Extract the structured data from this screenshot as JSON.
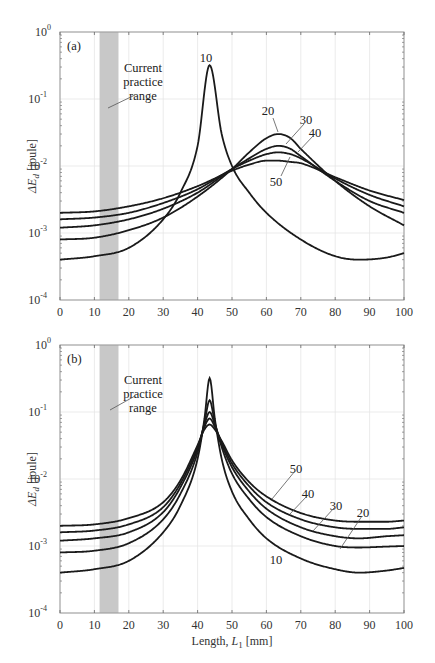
{
  "chart_data": [
    {
      "type": "line",
      "panel_label": "(a)",
      "ylabel": "ΔE_d [joule]",
      "xlabel": "",
      "yscale": "log",
      "xlim": [
        0,
        100
      ],
      "ylim": [
        0.0001,
        1
      ],
      "grid": true,
      "x_ticks": [
        "0",
        "10",
        "20",
        "30",
        "40",
        "50",
        "60",
        "70",
        "80",
        "90",
        "100"
      ],
      "y_ticks": [
        {
          "base": "10",
          "exp": "0"
        },
        {
          "base": "10",
          "exp": "-1"
        },
        {
          "base": "10",
          "exp": "-2"
        },
        {
          "base": "10",
          "exp": "-3"
        },
        {
          "base": "10",
          "exp": "-4"
        }
      ],
      "shaded_region": {
        "x_from": 11.5,
        "x_to": 17,
        "label": [
          "Current",
          "practice",
          "range"
        ]
      },
      "series": [
        {
          "name": "10",
          "x": [
            0,
            10,
            20,
            30,
            35,
            40,
            43.5,
            47,
            50,
            55,
            60,
            70,
            80,
            87,
            95,
            100
          ],
          "y": [
            0.0004,
            0.00045,
            0.0006,
            0.0016,
            0.004,
            0.02,
            0.32,
            0.03,
            0.01,
            0.004,
            0.002,
            0.0008,
            0.00045,
            0.0004,
            0.00043,
            0.0005
          ]
        },
        {
          "name": "20",
          "x": [
            0,
            10,
            20,
            30,
            40,
            50,
            55,
            60,
            63.5,
            67,
            70,
            80,
            90,
            100
          ],
          "y": [
            0.0008,
            0.00085,
            0.0011,
            0.0017,
            0.0035,
            0.009,
            0.016,
            0.026,
            0.03,
            0.026,
            0.018,
            0.006,
            0.0025,
            0.0013
          ]
        },
        {
          "name": "30",
          "x": [
            0,
            10,
            20,
            30,
            40,
            50,
            55,
            60,
            63.5,
            67,
            70,
            80,
            90,
            100
          ],
          "y": [
            0.0012,
            0.0013,
            0.0016,
            0.0023,
            0.004,
            0.009,
            0.013,
            0.018,
            0.02,
            0.018,
            0.014,
            0.006,
            0.003,
            0.002
          ]
        },
        {
          "name": "40",
          "x": [
            0,
            10,
            20,
            30,
            40,
            50,
            55,
            60,
            63.5,
            67,
            70,
            80,
            90,
            100
          ],
          "y": [
            0.0016,
            0.0017,
            0.002,
            0.0028,
            0.0045,
            0.009,
            0.012,
            0.015,
            0.016,
            0.015,
            0.013,
            0.0065,
            0.0037,
            0.0025
          ]
        },
        {
          "name": "50",
          "x": [
            0,
            10,
            20,
            30,
            40,
            50,
            55,
            60,
            63.5,
            67,
            70,
            80,
            90,
            100
          ],
          "y": [
            0.002,
            0.0021,
            0.0025,
            0.0033,
            0.005,
            0.0085,
            0.0105,
            0.012,
            0.012,
            0.0115,
            0.011,
            0.0068,
            0.0043,
            0.0031
          ]
        }
      ],
      "annotations": [
        {
          "text": "10",
          "series": "10"
        },
        {
          "text": "20",
          "series": "20"
        },
        {
          "text": "30",
          "series": "30"
        },
        {
          "text": "40",
          "series": "40"
        },
        {
          "text": "50",
          "series": "50"
        }
      ]
    },
    {
      "type": "line",
      "panel_label": "(b)",
      "ylabel": "ΔE_d [joule]",
      "xlabel": "Length, L_1 [mm]",
      "yscale": "log",
      "xlim": [
        0,
        100
      ],
      "ylim": [
        0.0001,
        1
      ],
      "grid": true,
      "x_ticks": [
        "0",
        "10",
        "20",
        "30",
        "40",
        "50",
        "60",
        "70",
        "80",
        "90",
        "100"
      ],
      "y_ticks": [
        {
          "base": "10",
          "exp": "0"
        },
        {
          "base": "10",
          "exp": "-1"
        },
        {
          "base": "10",
          "exp": "-2"
        },
        {
          "base": "10",
          "exp": "-3"
        },
        {
          "base": "10",
          "exp": "-4"
        }
      ],
      "shaded_region": {
        "x_from": 11.5,
        "x_to": 17,
        "label": [
          "Current",
          "practice",
          "range"
        ]
      },
      "series": [
        {
          "name": "10",
          "x": [
            0,
            10,
            20,
            30,
            35,
            40,
            42,
            43.5,
            45,
            47,
            50,
            55,
            60,
            70,
            80,
            87,
            95,
            100
          ],
          "y": [
            0.0004,
            0.00045,
            0.0006,
            0.0016,
            0.004,
            0.02,
            0.08,
            0.32,
            0.08,
            0.02,
            0.0065,
            0.0025,
            0.0013,
            0.00065,
            0.00045,
            0.0004,
            0.00043,
            0.00047
          ]
        },
        {
          "name": "20",
          "x": [
            0,
            10,
            20,
            30,
            35,
            40,
            42,
            43.5,
            45,
            47,
            50,
            55,
            60,
            70,
            80,
            87,
            95,
            100
          ],
          "y": [
            0.0008,
            0.00085,
            0.0011,
            0.0025,
            0.006,
            0.025,
            0.07,
            0.15,
            0.07,
            0.03,
            0.012,
            0.005,
            0.0027,
            0.0014,
            0.001,
            0.00095,
            0.00098,
            0.001
          ]
        },
        {
          "name": "30",
          "x": [
            0,
            10,
            20,
            30,
            35,
            40,
            42,
            43.5,
            45,
            47,
            50,
            55,
            60,
            70,
            80,
            87,
            95,
            100
          ],
          "y": [
            0.0012,
            0.0013,
            0.0016,
            0.0032,
            0.0075,
            0.028,
            0.065,
            0.1,
            0.065,
            0.033,
            0.015,
            0.0065,
            0.0036,
            0.0019,
            0.0014,
            0.0013,
            0.0014,
            0.00145
          ]
        },
        {
          "name": "40",
          "x": [
            0,
            10,
            20,
            30,
            35,
            40,
            42,
            43.5,
            45,
            47,
            50,
            55,
            60,
            70,
            80,
            87,
            95,
            100
          ],
          "y": [
            0.0016,
            0.0017,
            0.0021,
            0.0038,
            0.0085,
            0.03,
            0.06,
            0.08,
            0.06,
            0.035,
            0.017,
            0.0078,
            0.0045,
            0.0025,
            0.0019,
            0.0018,
            0.0018,
            0.0019
          ]
        },
        {
          "name": "50",
          "x": [
            0,
            10,
            20,
            30,
            35,
            40,
            42,
            43.5,
            45,
            47,
            50,
            55,
            60,
            70,
            80,
            87,
            95,
            100
          ],
          "y": [
            0.002,
            0.0021,
            0.0026,
            0.0045,
            0.0095,
            0.032,
            0.055,
            0.065,
            0.055,
            0.037,
            0.019,
            0.009,
            0.0055,
            0.0031,
            0.0024,
            0.0023,
            0.0023,
            0.0024
          ]
        }
      ],
      "annotations": [
        {
          "text": "50",
          "series": "50"
        },
        {
          "text": "40",
          "series": "40"
        },
        {
          "text": "30",
          "series": "30"
        },
        {
          "text": "20",
          "series": "20"
        },
        {
          "text": "10",
          "series": "10"
        }
      ]
    }
  ]
}
